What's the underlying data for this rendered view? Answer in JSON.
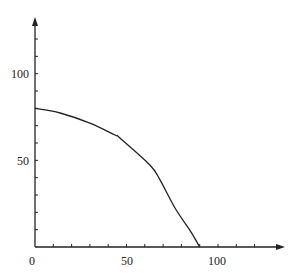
{
  "chart_data": {
    "type": "line",
    "title": "",
    "xlabel": "",
    "ylabel": "",
    "xlim": [
      0,
      130
    ],
    "ylim": [
      0,
      130
    ],
    "x_ticks": [
      0,
      10,
      20,
      30,
      40,
      50,
      60,
      70,
      80,
      90,
      100,
      110,
      120
    ],
    "y_ticks": [
      10,
      20,
      30,
      40,
      50,
      60,
      70,
      80,
      90,
      100,
      110,
      120
    ],
    "x_tick_labels": [
      "0",
      "50",
      "100"
    ],
    "y_tick_labels": [
      "50",
      "100"
    ],
    "grid": false,
    "legend": null,
    "axes_arrows": true,
    "series": [
      {
        "name": "curve",
        "color": "#222222",
        "x": [
          0,
          13.7,
          30,
          43.7,
          46.4,
          62.8,
          68.3,
          76.5,
          85,
          90
        ],
        "y": [
          80,
          77.3,
          71.5,
          64.6,
          62.9,
          47.3,
          38.7,
          22.5,
          9,
          0
        ]
      }
    ],
    "annotations": {
      "y_intercept": 80,
      "x_intercept": 90
    }
  },
  "labels": {
    "x_origin": "0",
    "x_50": "50",
    "x_100": "100",
    "y_50": "50",
    "y_100": "100"
  },
  "colors": {
    "axis": "#222222",
    "curve": "#222222",
    "background": "#ffffff"
  }
}
